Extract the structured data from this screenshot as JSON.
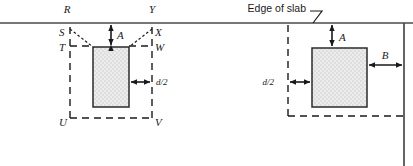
{
  "figure": {
    "title_note": "Edge of slab",
    "fill_color": "#e9e9e9",
    "line_color": "#1a1a1a",
    "slab_edge_color": "#4a4a4a",
    "background": "#ffffff"
  },
  "left_diagram": {
    "name": "corner-column-critical-perimeter",
    "corner_labels": {
      "r": "R",
      "s": "S",
      "t": "T",
      "u": "U",
      "v": "V",
      "w": "W",
      "x": "X",
      "y": "Y"
    },
    "dimensions": {
      "a": "A",
      "d_half": "d/2"
    }
  },
  "right_diagram": {
    "name": "edge-column-critical-perimeter",
    "dimensions": {
      "a": "A",
      "b": "B",
      "d_half": "d/2"
    }
  }
}
